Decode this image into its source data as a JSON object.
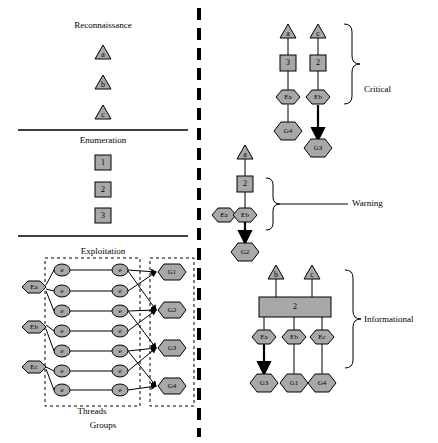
{
  "diagram": {
    "divider": "vertical-dashed-separator",
    "left_panel": {
      "sections": [
        {
          "name": "reconnaissance",
          "label": "Reconnaissance",
          "nodes": [
            {
              "id": "recon-a",
              "text": "a",
              "shape": "triangle",
              "x": 103,
              "y": 52
            },
            {
              "id": "recon-b",
              "text": "b",
              "shape": "triangle",
              "x": 103,
              "y": 82
            },
            {
              "id": "recon-c",
              "text": "c",
              "shape": "triangle",
              "x": 103,
              "y": 112
            }
          ]
        },
        {
          "name": "enumeration",
          "label": "Enumeration",
          "nodes": [
            {
              "id": "enum-1",
              "text": "1",
              "shape": "square",
              "x": 103,
              "y": 163
            },
            {
              "id": "enum-2",
              "text": "2",
              "shape": "square",
              "x": 103,
              "y": 190
            },
            {
              "id": "enum-3",
              "text": "3",
              "shape": "square",
              "x": 103,
              "y": 216
            }
          ]
        },
        {
          "name": "exploitation",
          "label": "Exploitation",
          "sub_labels": [
            "Threads",
            "Groups"
          ],
          "exploit_nodes": [
            {
              "id": "ex-Ea",
              "text": "Ea",
              "shape": "hexagon",
              "x": 33,
              "y": 293
            },
            {
              "id": "ex-Eb",
              "text": "Eb",
              "shape": "hexagon",
              "x": 33,
              "y": 332
            },
            {
              "id": "ex-Ec",
              "text": "Ec",
              "shape": "hexagon",
              "x": 33,
              "y": 372
            }
          ],
          "thread_rows": [
            {
              "left": "e",
              "right": "e",
              "y": 272
            },
            {
              "left": "e",
              "right": "e",
              "y": 293
            },
            {
              "left": "e",
              "right": "e",
              "y": 313
            },
            {
              "left": "e",
              "right": "e",
              "y": 333
            },
            {
              "left": "e",
              "right": "e",
              "y": 353
            },
            {
              "left": "e",
              "right": "e",
              "y": 373
            },
            {
              "left": "e",
              "right": "e",
              "y": 391
            }
          ],
          "group_nodes": [
            {
              "id": "grp-G1",
              "text": "G1",
              "shape": "hexagon",
              "x": 172,
              "y": 272
            },
            {
              "id": "grp-G2",
              "text": "G2",
              "shape": "hexagon",
              "x": 172,
              "y": 310
            },
            {
              "id": "grp-G3",
              "text": "G3",
              "shape": "hexagon",
              "x": 172,
              "y": 348
            },
            {
              "id": "grp-G4",
              "text": "G4",
              "shape": "hexagon",
              "x": 172,
              "y": 386
            }
          ]
        }
      ]
    },
    "right_panel": {
      "groups": [
        {
          "name": "critical",
          "label": "Critical",
          "nodes": [
            {
              "id": "crit-a",
              "text": "a",
              "shape": "triangle",
              "x": 288,
              "y": 31
            },
            {
              "id": "crit-c",
              "text": "c",
              "shape": "triangle",
              "x": 318,
              "y": 31
            },
            {
              "id": "crit-3",
              "text": "3",
              "shape": "square",
              "x": 288,
              "y": 63
            },
            {
              "id": "crit-2",
              "text": "2",
              "shape": "square",
              "x": 318,
              "y": 63
            },
            {
              "id": "crit-Ea",
              "text": "Ea",
              "shape": "hexagon",
              "x": 288,
              "y": 97
            },
            {
              "id": "crit-Eb",
              "text": "Eb",
              "shape": "hexagon",
              "x": 318,
              "y": 97
            },
            {
              "id": "crit-G4",
              "text": "G4",
              "shape": "hexagon",
              "x": 288,
              "y": 131
            },
            {
              "id": "crit-G3",
              "text": "G3",
              "shape": "hexagon",
              "x": 318,
              "y": 148
            }
          ]
        },
        {
          "name": "warning",
          "label": "Warning",
          "nodes": [
            {
              "id": "warn-a",
              "text": "a",
              "shape": "triangle",
              "x": 245,
              "y": 152
            },
            {
              "id": "warn-2",
              "text": "2",
              "shape": "square",
              "x": 245,
              "y": 184
            },
            {
              "id": "warn-Ea",
              "text": "Ea",
              "shape": "hexagon",
              "x": 224,
              "y": 215
            },
            {
              "id": "warn-Eb",
              "text": "Eb",
              "shape": "hexagon",
              "x": 245,
              "y": 215
            },
            {
              "id": "warn-G2",
              "text": "G2",
              "shape": "hexagon",
              "x": 245,
              "y": 252
            }
          ]
        },
        {
          "name": "informational",
          "label": "Informational",
          "nodes": [
            {
              "id": "info-b",
              "text": "b",
              "shape": "triangle",
              "x": 276,
              "y": 272
            },
            {
              "id": "info-c",
              "text": "c",
              "shape": "triangle",
              "x": 312,
              "y": 272
            },
            {
              "id": "info-2",
              "text": "2",
              "shape": "square-wide",
              "x": 294,
              "y": 307
            },
            {
              "id": "info-Ea",
              "text": "Ea",
              "shape": "hexagon",
              "x": 264,
              "y": 337
            },
            {
              "id": "info-Eb",
              "text": "Eb",
              "shape": "hexagon",
              "x": 294,
              "y": 337
            },
            {
              "id": "info-Ec",
              "text": "Ec",
              "shape": "hexagon",
              "x": 322,
              "y": 337
            },
            {
              "id": "info-G3",
              "text": "G3",
              "shape": "hexagon",
              "x": 264,
              "y": 383
            },
            {
              "id": "info-G1",
              "text": "G1",
              "shape": "hexagon",
              "x": 294,
              "y": 383
            },
            {
              "id": "info-G4",
              "text": "G4",
              "shape": "hexagon",
              "x": 322,
              "y": 383
            }
          ]
        }
      ]
    },
    "colors": {
      "node_fill": "#a8a8a8",
      "stroke": "#000000",
      "background": "#ffffff"
    }
  }
}
